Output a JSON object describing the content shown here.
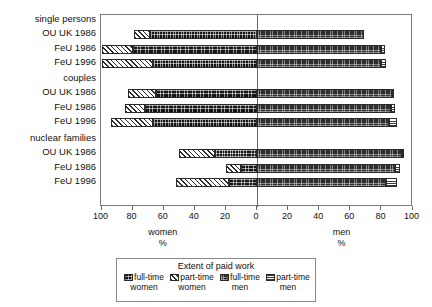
{
  "chart_data": {
    "type": "bar",
    "orientation": "horizontal",
    "subtype": "diverging-stacked",
    "title": "",
    "xlabel": "",
    "ylabel": "",
    "axis": {
      "tick_labels": [
        "100",
        "80",
        "60",
        "40",
        "20",
        "0",
        "20",
        "40",
        "60",
        "80",
        "100"
      ],
      "tick_values": [
        -100,
        -80,
        -60,
        -40,
        -20,
        0,
        20,
        40,
        60,
        80,
        100
      ],
      "xlim": [
        -100,
        100
      ],
      "grid": false,
      "left_caption": "women",
      "left_caption_unit": "%",
      "right_caption": "men",
      "right_caption_unit": "%"
    },
    "legend": {
      "title": "Extent of paid work",
      "position": "bottom",
      "entries": [
        {
          "label_line1": "full-time",
          "label_line2": "women",
          "key": "ft-w"
        },
        {
          "label_line1": "part-time",
          "label_line2": "women",
          "key": "pt-w"
        },
        {
          "label_line1": "full-time",
          "label_line2": "men",
          "key": "ft-m"
        },
        {
          "label_line1": "part-time",
          "label_line2": "men",
          "key": "pt-m"
        }
      ]
    },
    "groups": [
      {
        "name": "single persons",
        "rows": [
          {
            "label": "OU UK 1986",
            "women_full_time": 69,
            "women_part_time": 10,
            "men_full_time": 69,
            "men_part_time": 0
          },
          {
            "label": "FeU 1986",
            "women_full_time": 80,
            "women_part_time": 20,
            "men_full_time": 80,
            "men_part_time": 2
          },
          {
            "label": "FeU 1996",
            "women_full_time": 67,
            "women_part_time": 33,
            "men_full_time": 80,
            "men_part_time": 3
          }
        ]
      },
      {
        "name": "couples",
        "rows": [
          {
            "label": "OU UK 1986",
            "women_full_time": 65,
            "women_part_time": 18,
            "men_full_time": 87,
            "men_part_time": 1
          },
          {
            "label": "FeU 1986",
            "women_full_time": 72,
            "women_part_time": 13,
            "men_full_time": 86,
            "men_part_time": 3
          },
          {
            "label": "FeU 1996",
            "women_full_time": 67,
            "women_part_time": 27,
            "men_full_time": 85,
            "men_part_time": 5
          }
        ]
      },
      {
        "name": "nuclear families",
        "rows": [
          {
            "label": "OU UK 1986",
            "women_full_time": 27,
            "women_part_time": 23,
            "men_full_time": 93,
            "men_part_time": 1
          },
          {
            "label": "FeU 1986",
            "women_full_time": 10,
            "women_part_time": 10,
            "men_full_time": 89,
            "men_part_time": 3
          },
          {
            "label": "FeU 1996",
            "women_full_time": 18,
            "women_part_time": 34,
            "men_full_time": 83,
            "men_part_time": 7
          }
        ]
      }
    ]
  }
}
